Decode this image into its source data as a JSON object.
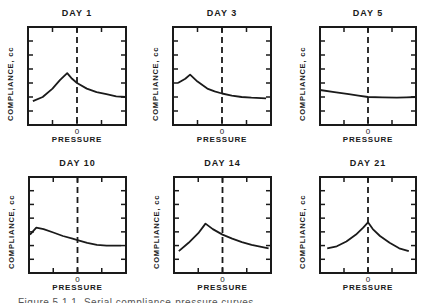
{
  "figure": {
    "axis": {
      "ylabel": "COMPLIANCE, cc",
      "xlabel": "PRESSURE",
      "x_zero_label": "0"
    },
    "caption": "Figure 5.1.1. Serial compliance-pressure curves"
  },
  "chart_data": [
    {
      "type": "line",
      "title": "DAY 1",
      "xlabel": "PRESSURE",
      "ylabel": "COMPLIANCE, cc",
      "x_tick_labels": [
        "0"
      ],
      "xlim": [
        -1,
        1
      ],
      "ylim": [
        0,
        7
      ],
      "reference_line": {
        "x": 0,
        "style": "dashed"
      },
      "grid": false,
      "series": [
        {
          "name": "compliance",
          "x": [
            -0.9,
            -0.7,
            -0.5,
            -0.35,
            -0.2,
            -0.1,
            0.0,
            0.2,
            0.4,
            0.6,
            0.8,
            1.0
          ],
          "y": [
            1.7,
            2.0,
            2.6,
            3.2,
            3.7,
            3.3,
            3.0,
            2.6,
            2.35,
            2.2,
            2.05,
            2.0
          ]
        }
      ]
    },
    {
      "type": "line",
      "title": "DAY 3",
      "xlabel": "PRESSURE",
      "ylabel": "COMPLIANCE, cc",
      "x_tick_labels": [
        "0"
      ],
      "xlim": [
        -1,
        1
      ],
      "ylim": [
        0,
        7
      ],
      "reference_line": {
        "x": 0,
        "style": "dashed"
      },
      "grid": false,
      "series": [
        {
          "name": "compliance",
          "x": [
            -0.9,
            -0.75,
            -0.65,
            -0.5,
            -0.3,
            -0.15,
            0.0,
            0.2,
            0.4,
            0.6,
            0.9
          ],
          "y": [
            3.0,
            3.3,
            3.6,
            3.1,
            2.6,
            2.4,
            2.25,
            2.1,
            2.0,
            1.95,
            1.9
          ]
        }
      ]
    },
    {
      "type": "line",
      "title": "DAY 5",
      "xlabel": "PRESSURE",
      "ylabel": "COMPLIANCE, cc",
      "x_tick_labels": [
        "0"
      ],
      "xlim": [
        -1,
        1
      ],
      "ylim": [
        0,
        7
      ],
      "reference_line": {
        "x": 0,
        "style": "dashed"
      },
      "grid": false,
      "series": [
        {
          "name": "compliance",
          "x": [
            -1.0,
            -0.7,
            -0.4,
            -0.2,
            0.0,
            0.3,
            0.6,
            0.8,
            1.0
          ],
          "y": [
            2.5,
            2.35,
            2.2,
            2.1,
            2.0,
            1.97,
            1.95,
            1.97,
            2.0
          ]
        }
      ]
    },
    {
      "type": "line",
      "title": "DAY 10",
      "xlabel": "PRESSURE",
      "ylabel": "COMPLIANCE, cc",
      "x_tick_labels": [
        "0"
      ],
      "xlim": [
        -1,
        1
      ],
      "ylim": [
        0,
        7
      ],
      "reference_line": {
        "x": 0,
        "style": "dashed"
      },
      "grid": false,
      "series": [
        {
          "name": "compliance",
          "x": [
            -0.98,
            -0.85,
            -0.7,
            -0.5,
            -0.3,
            -0.1,
            0.0,
            0.2,
            0.4,
            0.6,
            0.9
          ],
          "y": [
            2.8,
            3.3,
            3.2,
            2.95,
            2.7,
            2.5,
            2.4,
            2.2,
            2.05,
            2.0,
            2.0
          ]
        }
      ]
    },
    {
      "type": "line",
      "title": "DAY 14",
      "xlabel": "PRESSURE",
      "ylabel": "COMPLIANCE, cc",
      "x_tick_labels": [
        "0"
      ],
      "xlim": [
        -1,
        1
      ],
      "ylim": [
        0,
        7
      ],
      "reference_line": {
        "x": 0,
        "style": "dashed"
      },
      "grid": false,
      "series": [
        {
          "name": "compliance",
          "x": [
            -0.9,
            -0.7,
            -0.5,
            -0.35,
            -0.2,
            0.0,
            0.2,
            0.4,
            0.6,
            0.8,
            0.95
          ],
          "y": [
            1.6,
            2.2,
            2.9,
            3.6,
            3.2,
            2.8,
            2.5,
            2.25,
            2.05,
            1.9,
            1.8
          ]
        }
      ]
    },
    {
      "type": "line",
      "title": "DAY 21",
      "xlabel": "PRESSURE",
      "ylabel": "COMPLIANCE, cc",
      "x_tick_labels": [
        "0"
      ],
      "xlim": [
        -1,
        1
      ],
      "ylim": [
        0,
        7
      ],
      "reference_line": {
        "x": 0,
        "style": "dashed"
      },
      "grid": false,
      "series": [
        {
          "name": "compliance",
          "x": [
            -0.85,
            -0.65,
            -0.45,
            -0.25,
            -0.1,
            0.0,
            0.1,
            0.25,
            0.45,
            0.65,
            0.85
          ],
          "y": [
            1.8,
            1.95,
            2.3,
            2.8,
            3.3,
            3.7,
            3.2,
            2.7,
            2.2,
            1.8,
            1.6
          ]
        }
      ]
    }
  ],
  "layout": {
    "panels": [
      {
        "box": [
          28,
          27,
          98,
          98
        ]
      },
      {
        "box": [
          173,
          27,
          98,
          98
        ]
      },
      {
        "box": [
          320,
          27,
          96,
          98
        ]
      },
      {
        "box": [
          29,
          177,
          97,
          96
        ]
      },
      {
        "box": [
          174,
          177,
          97,
          96
        ]
      },
      {
        "box": [
          320,
          177,
          96,
          96
        ]
      }
    ]
  }
}
